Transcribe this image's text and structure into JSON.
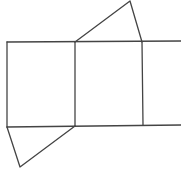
{
  "diagram": {
    "type": "geometric-net",
    "stroke_color": "#444444",
    "stroke_width": 1.3,
    "background": "#ffffff",
    "points": {
      "top_left": [
        7,
        42
      ],
      "top_mid": [
        75,
        42
      ],
      "top_right": [
        142,
        42
      ],
      "top_end": [
        181,
        41
      ],
      "bottom_left": [
        7,
        127
      ],
      "bottom_mid": [
        75,
        126
      ],
      "bottom_right": [
        143,
        125
      ],
      "bottom_end": [
        181,
        125
      ],
      "top_apex": [
        130,
        1
      ],
      "bottom_apex": [
        20,
        167
      ]
    },
    "shapes": [
      {
        "name": "rectangle-left",
        "kind": "rectangle"
      },
      {
        "name": "rectangle-middle",
        "kind": "rectangle"
      },
      {
        "name": "rectangle-right-partial",
        "kind": "rectangle"
      },
      {
        "name": "triangle-top",
        "kind": "triangle"
      },
      {
        "name": "triangle-bottom",
        "kind": "triangle"
      }
    ]
  }
}
